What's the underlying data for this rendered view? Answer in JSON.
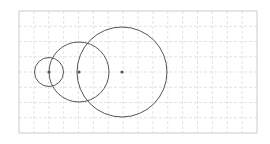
{
  "diagram": {
    "type": "geometry-circles",
    "background": "#ffffff",
    "grid": {
      "x": 19,
      "y": 11,
      "width": 238,
      "height": 122,
      "cols": 16,
      "rows": 8,
      "line_color": "#dcdcdc",
      "border_color": "#cccccc",
      "dashed": true
    },
    "stroke_color": "#555555",
    "center_color": "#555555",
    "circles": [
      {
        "id": "small",
        "cx": 49,
        "cy": 72,
        "r": 14.5
      },
      {
        "id": "medium",
        "cx": 79,
        "cy": 72,
        "r": 30
      },
      {
        "id": "large",
        "cx": 122,
        "cy": 72,
        "r": 45
      }
    ]
  }
}
